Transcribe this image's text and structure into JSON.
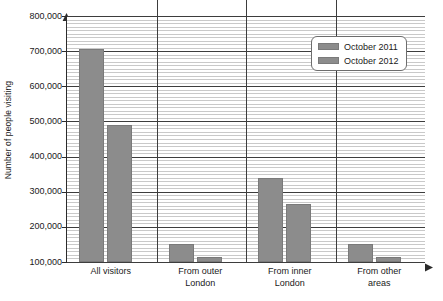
{
  "chart_data": {
    "type": "bar",
    "title": "",
    "xlabel": "",
    "ylabel": "Number of people visiting",
    "ylim": [
      100000,
      800000
    ],
    "grid": true,
    "grid_major_step": 100000,
    "grid_minor_step": 10000,
    "legend_position": "top-right",
    "categories": [
      "All visitors",
      "From outer London",
      "From inner London",
      "From other areas"
    ],
    "category_lines": [
      [
        "All visitors"
      ],
      [
        "From outer",
        "London"
      ],
      [
        "From inner",
        "London"
      ],
      [
        "From other",
        "areas"
      ]
    ],
    "series": [
      {
        "name": "October 2011",
        "color": "#8c8c8c",
        "values": [
          705000,
          150000,
          340000,
          150000
        ]
      },
      {
        "name": "October 2012",
        "color": "#8c8c8c",
        "values": [
          490000,
          115000,
          265000,
          115000
        ]
      }
    ],
    "y_tick_labels": [
      "800,000",
      "700,000",
      "600,000",
      "500,000",
      "400,000",
      "300,000",
      "200,000",
      "100,000"
    ],
    "y_tick_values": [
      800000,
      700000,
      600000,
      500000,
      400000,
      300000,
      200000,
      100000
    ]
  },
  "legend": {
    "entries": [
      {
        "label": "October 2011"
      },
      {
        "label": "October 2012"
      }
    ]
  },
  "axes": {
    "y_title": "Number of people visiting"
  },
  "colors": {
    "bar": "#8c8c8c",
    "grid_major": "#3d3d3d",
    "grid_minor": "#c9c9c9",
    "axis": "#2b2b2b",
    "text": "#1a1a1a"
  }
}
